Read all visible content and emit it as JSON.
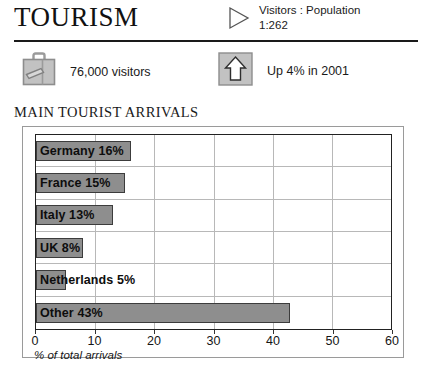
{
  "header": {
    "title": "TOURISM",
    "ratio_icon": "triangle-right-icon",
    "ratio_label": "Visitors : Population",
    "ratio_value": "1:262"
  },
  "stats": [
    {
      "icon": "suitcase-icon",
      "label": "76,000 visitors"
    },
    {
      "icon": "up-arrow-icon",
      "label": "Up 4% in 2001"
    }
  ],
  "chart_section": {
    "heading": "MAIN TOURIST ARRIVALS"
  },
  "chart_data": {
    "type": "bar",
    "orientation": "horizontal",
    "title": "MAIN TOURIST ARRIVALS",
    "xlabel": "% of total arrivals",
    "ylabel": "",
    "xlim": [
      0,
      60
    ],
    "xticks": [
      0,
      10,
      20,
      30,
      40,
      50,
      60
    ],
    "xtick_labels": [
      "0",
      "10",
      "20",
      "30",
      "40",
      "50",
      "60"
    ],
    "grid": true,
    "legend": "none",
    "categories": [
      "Germany",
      "France",
      "Italy",
      "UK",
      "Netherlands",
      "Other"
    ],
    "values": [
      16,
      15,
      13,
      8,
      5,
      43
    ],
    "bar_labels": [
      "Germany 16%",
      "France 15%",
      "Italy 13%",
      "UK 8%",
      "Netherlands 5%",
      "Other 43%"
    ],
    "bar_color": "#8e8e8e",
    "bar_border_color": "#3c3c3c"
  },
  "colors": {
    "rule": "#1a1a1a",
    "icon_gray": "#b4b4b4",
    "icon_outline": "#6e6e6e",
    "gridline": "#b8b8b8"
  }
}
